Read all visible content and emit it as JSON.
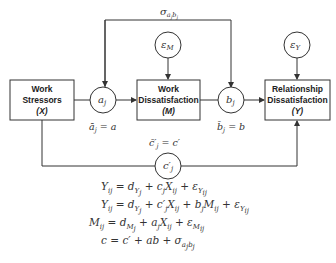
{
  "diagram": {
    "type": "multilevel mediation path diagram",
    "nodes": {
      "x": {
        "line1": "Work",
        "line2": "Stressors",
        "line3": "(X)"
      },
      "m": {
        "line1": "Work",
        "line2": "Dissatisfaction",
        "line3": "(M)"
      },
      "y": {
        "line1": "Relationship",
        "line2": "Dissatisfaction",
        "line3": "(Y)"
      }
    },
    "paths": {
      "a": {
        "label": "a",
        "sub": "j",
        "mean_label": "ā",
        "mean_sub": "j",
        "mean_eq": " = a"
      },
      "b": {
        "label": "b",
        "sub": "j",
        "mean_label": "b̄",
        "mean_sub": "j",
        "mean_eq": " = b"
      },
      "c": {
        "label": "c′",
        "sub": "j",
        "mean_label": "c̄′",
        "mean_sub": "j",
        "mean_eq": " = c′"
      },
      "sigma": {
        "label": "σ",
        "sub": "a_j b_j"
      }
    },
    "errors": {
      "m": {
        "label": "ε",
        "sub": "M"
      },
      "y": {
        "label": "ε",
        "sub": "Y"
      }
    },
    "colors": {
      "line": "#333333",
      "text": "#222222",
      "background": "#ffffff"
    }
  },
  "equations": [
    "Y_ij = d_Yj + c_j X_ij + ε_Yij",
    "Y_ij = d_Yj + c'_j X_ij + b_j M_ij + ε_Yij",
    "M_ij = d_Mj + a_j X_ij + ε_Mij",
    "c = c' + ab + σ_ajbj"
  ]
}
